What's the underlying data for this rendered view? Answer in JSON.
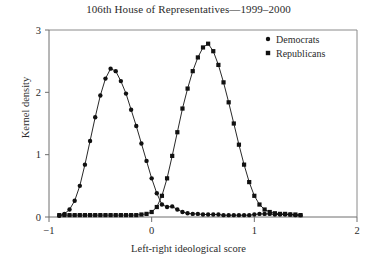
{
  "figure": {
    "title": "106th House of Representatives—1999–2000",
    "caption": ""
  },
  "chart_data": {
    "type": "line",
    "title": "106th House of Representatives—1999–2000",
    "xlabel": "Left-right ideological score",
    "ylabel": "Kernel density",
    "xlim": [
      -1,
      2
    ],
    "ylim": [
      0,
      3
    ],
    "xticks": [
      -1,
      0,
      1,
      2
    ],
    "xtick_labels": [
      "−1",
      "0",
      "1",
      "2"
    ],
    "yticks": [
      0,
      1,
      2,
      3
    ],
    "ytick_labels": [
      "0",
      "1",
      "2",
      "3"
    ],
    "grid": false,
    "legend_position": "top-right",
    "markers": {
      "Democrats": "circle",
      "Republicans": "square"
    },
    "series": [
      {
        "name": "Democrats",
        "marker": "circle",
        "color": "#111111",
        "x": [
          -0.9,
          -0.85,
          -0.8,
          -0.75,
          -0.7,
          -0.65,
          -0.6,
          -0.55,
          -0.5,
          -0.45,
          -0.4,
          -0.35,
          -0.3,
          -0.25,
          -0.2,
          -0.15,
          -0.1,
          -0.05,
          0.0,
          0.05,
          0.1,
          0.15,
          0.2,
          0.25,
          0.3,
          0.35,
          0.4,
          0.45,
          0.5,
          0.55,
          0.6,
          0.65,
          0.7,
          0.75,
          0.8,
          0.85,
          0.9,
          0.95,
          1.0,
          1.05,
          1.1,
          1.15,
          1.2,
          1.25,
          1.3,
          1.35,
          1.4,
          1.45
        ],
        "y": [
          0.02,
          0.05,
          0.12,
          0.26,
          0.5,
          0.84,
          1.22,
          1.6,
          1.95,
          2.22,
          2.38,
          2.34,
          2.18,
          1.98,
          1.72,
          1.46,
          1.18,
          0.9,
          0.62,
          0.38,
          0.2,
          0.16,
          0.17,
          0.12,
          0.08,
          0.06,
          0.05,
          0.05,
          0.04,
          0.04,
          0.04,
          0.04,
          0.03,
          0.03,
          0.03,
          0.03,
          0.03,
          0.03,
          0.04,
          0.05,
          0.05,
          0.05,
          0.04,
          0.04,
          0.04,
          0.04,
          0.03,
          0.03
        ]
      },
      {
        "name": "Republicans",
        "marker": "square",
        "color": "#111111",
        "x": [
          -0.9,
          -0.85,
          -0.8,
          -0.75,
          -0.7,
          -0.65,
          -0.6,
          -0.55,
          -0.5,
          -0.45,
          -0.4,
          -0.35,
          -0.3,
          -0.25,
          -0.2,
          -0.15,
          -0.1,
          -0.05,
          0.0,
          0.05,
          0.1,
          0.15,
          0.2,
          0.25,
          0.3,
          0.35,
          0.4,
          0.45,
          0.5,
          0.55,
          0.6,
          0.65,
          0.7,
          0.75,
          0.8,
          0.85,
          0.9,
          0.95,
          1.0,
          1.05,
          1.1,
          1.15,
          1.2,
          1.25,
          1.3,
          1.35,
          1.4,
          1.45
        ],
        "y": [
          0.03,
          0.03,
          0.03,
          0.03,
          0.03,
          0.03,
          0.03,
          0.03,
          0.03,
          0.03,
          0.03,
          0.03,
          0.03,
          0.03,
          0.03,
          0.03,
          0.04,
          0.05,
          0.08,
          0.16,
          0.34,
          0.62,
          0.98,
          1.36,
          1.74,
          2.06,
          2.34,
          2.56,
          2.72,
          2.78,
          2.66,
          2.44,
          2.16,
          1.84,
          1.5,
          1.16,
          0.84,
          0.56,
          0.34,
          0.2,
          0.12,
          0.08,
          0.06,
          0.05,
          0.05,
          0.04,
          0.04,
          0.03
        ]
      }
    ]
  },
  "legend": {
    "items": [
      {
        "label": "Democrats",
        "marker": "circle"
      },
      {
        "label": "Republicans",
        "marker": "square"
      }
    ]
  }
}
